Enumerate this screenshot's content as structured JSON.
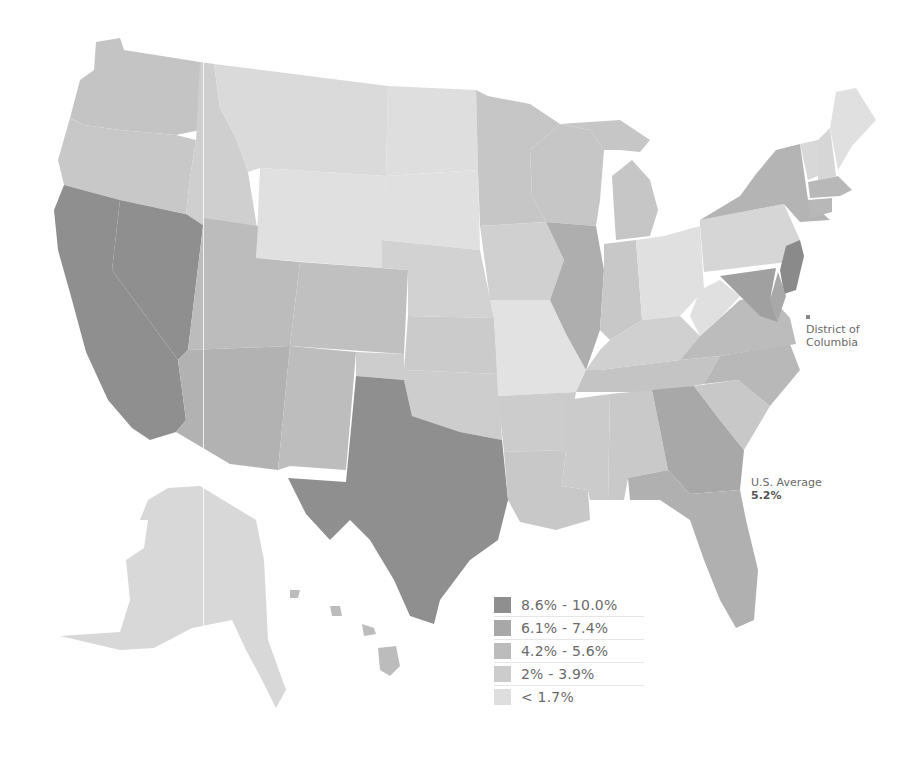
{
  "map": {
    "type": "choropleth",
    "region": "United States",
    "annotations": {
      "us_average_label": "U.S. Average",
      "us_average_value": "5.2%",
      "dc_label_line1": "District of",
      "dc_label_line2": "Columbia"
    },
    "legend": [
      {
        "label": "8.6% - 10.0%",
        "color": "#8f8f8f"
      },
      {
        "label": "6.1% - 7.4%",
        "color": "#a8a8a8"
      },
      {
        "label": "4.2% - 5.6%",
        "color": "#bcbcbc"
      },
      {
        "label": "2% - 3.9%",
        "color": "#cccccc"
      },
      {
        "label": "< 1.7%",
        "color": "#dedede"
      }
    ],
    "state_bins": {
      "WA": "#c4c4c4",
      "OR": "#c8c8c8",
      "CA": "#8f8f8f",
      "NV": "#8f8f8f",
      "ID": "#cfcfcf",
      "MT": "#dadada",
      "WY": "#e0e0e0",
      "UT": "#bcbcbc",
      "AZ": "#b2b2b2",
      "CO": "#c0c0c0",
      "NM": "#bdbdbd",
      "ND": "#dedede",
      "SD": "#e0e0e0",
      "NE": "#d2d2d2",
      "KS": "#cbcbcb",
      "OK": "#cdcdcd",
      "TX": "#8f8f8f",
      "MN": "#c6c6c6",
      "IA": "#d0d0d0",
      "MO": "#e2e2e2",
      "AR": "#cccccc",
      "LA": "#c8c8c8",
      "WI": "#c6c6c6",
      "IL": "#aeaeae",
      "MI": "#c6c6c6",
      "IN": "#c8c8c8",
      "OH": "#e0e0e0",
      "KY": "#d0d0d0",
      "TN": "#c4c4c4",
      "MS": "#cbcbcb",
      "AL": "#c9c9c9",
      "GA": "#a8a8a8",
      "FL": "#b0b0b0",
      "SC": "#c8c8c8",
      "NC": "#b8b8b8",
      "VA": "#bcbcbc",
      "WV": "#e0e0e0",
      "PA": "#d6d6d6",
      "NY": "#b4b4b4",
      "VT": "#d8d8d8",
      "NH": "#d6d6d6",
      "ME": "#e0e0e0",
      "MA": "#b8b8b8",
      "CT": "#b8b8b8",
      "NJ": "#8a8a8a",
      "DE": "#a8a8a8",
      "MD": "#a0a0a0",
      "AK": "#d8d8d8",
      "HI": "#bcbcbc"
    }
  }
}
